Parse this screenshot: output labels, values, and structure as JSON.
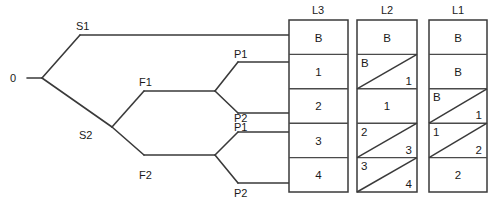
{
  "diagram": {
    "title": "",
    "type": "binary-tree-with-level-tables",
    "colors": {
      "line": "#3a3a3a",
      "background": "#ffffff",
      "text": "#1a1a1a"
    }
  },
  "tree": {
    "root": {
      "label": "0",
      "x": 18,
      "y": 78
    },
    "nodes": [
      {
        "id": "s1",
        "label": "S1",
        "label_x": 76,
        "label_y": 30,
        "vertex_x": 80,
        "vertex_y": 35
      },
      {
        "id": "s2",
        "label": "S2",
        "label_x": 79,
        "label_y": 138,
        "vertex_x": 112,
        "vertex_y": 127
      },
      {
        "id": "f1",
        "label": "F1",
        "label_x": 139,
        "label_y": 86,
        "vertex_x": 144,
        "vertex_y": 91
      },
      {
        "id": "f2",
        "label": "F2",
        "label_x": 139,
        "label_y": 178,
        "vertex_x": 144,
        "vertex_y": 155
      },
      {
        "id": "p1a",
        "label": "P1",
        "label_x": 235,
        "label_y": 58,
        "vertex_x": 238,
        "vertex_y": 62
      },
      {
        "id": "p2a",
        "label": "P2",
        "label_x": 235,
        "label_y": 122,
        "vertex_x": 238,
        "vertex_y": 113
      },
      {
        "id": "p1b",
        "label": "P1",
        "label_x": 235,
        "label_y": 130,
        "vertex_x": 238,
        "vertex_y": 132
      },
      {
        "id": "p2b",
        "label": "P2",
        "label_x": 235,
        "label_y": 196,
        "vertex_x": 238,
        "vertex_y": 183
      }
    ]
  },
  "columns": [
    {
      "header": "L3",
      "cells": [
        {
          "type": "single",
          "value": "B"
        },
        {
          "type": "single",
          "value": "1"
        },
        {
          "type": "single",
          "value": "2"
        },
        {
          "type": "single",
          "value": "3"
        },
        {
          "type": "single",
          "value": "4"
        }
      ]
    },
    {
      "header": "L2",
      "cells": [
        {
          "type": "single",
          "value": "B"
        },
        {
          "type": "split",
          "top_left": "B",
          "bottom_right": "1"
        },
        {
          "type": "single",
          "value": "1"
        },
        {
          "type": "split",
          "top_left": "2",
          "bottom_right": "3"
        },
        {
          "type": "split",
          "top_left": "3",
          "bottom_right": "4"
        }
      ]
    },
    {
      "header": "L1",
      "cells": [
        {
          "type": "single",
          "value": "B"
        },
        {
          "type": "single",
          "value": "B"
        },
        {
          "type": "split",
          "top_left": "B",
          "bottom_right": "1"
        },
        {
          "type": "split",
          "top_left": "1",
          "bottom_right": "2"
        },
        {
          "type": "single",
          "value": "2"
        }
      ]
    }
  ],
  "headers": {
    "l3": "L3",
    "l2": "L2",
    "l1": "L1"
  },
  "labels": {
    "root": "0",
    "s1": "S1",
    "s2": "S2",
    "f1": "F1",
    "f2": "F2",
    "p1_upper": "P1",
    "p2_upper": "P2",
    "p1_lower": "P1",
    "p2_lower": "P2"
  },
  "l3_values": {
    "r0": "B",
    "r1": "1",
    "r2": "2",
    "r3": "3",
    "r4": "4"
  },
  "l2_values": {
    "r0": "B",
    "r1_tl": "B",
    "r1_br": "1",
    "r2": "1",
    "r3_tl": "2",
    "r3_br": "3",
    "r4_tl": "3",
    "r4_br": "4"
  },
  "l1_values": {
    "r0": "B",
    "r1": "B",
    "r2_tl": "B",
    "r2_br": "1",
    "r3_tl": "1",
    "r3_br": "2",
    "r4": "2"
  }
}
